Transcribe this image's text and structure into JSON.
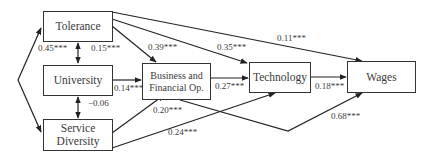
{
  "diagram": {
    "type": "path-model",
    "nodes": [
      {
        "id": "tolerance",
        "label": "Tolerance"
      },
      {
        "id": "university",
        "label": "University"
      },
      {
        "id": "service",
        "label": "Service Diversity",
        "lines": [
          "Service",
          "Diversity"
        ]
      },
      {
        "id": "business",
        "label": "Business and Financial Op.",
        "lines": [
          "Business and",
          "Financial Op."
        ]
      },
      {
        "id": "technology",
        "label": "Technology"
      },
      {
        "id": "wages",
        "label": "Wages"
      }
    ],
    "edges": [
      {
        "from": "tolerance",
        "to": "service",
        "type": "correlation",
        "label": "0.45***"
      },
      {
        "from": "tolerance",
        "to": "university",
        "type": "correlation",
        "label": "0.15***"
      },
      {
        "from": "university",
        "to": "service",
        "type": "correlation",
        "label": "-0.06"
      },
      {
        "from": "tolerance",
        "to": "business",
        "label": "0.39***"
      },
      {
        "from": "tolerance",
        "to": "technology",
        "label": "0.35***"
      },
      {
        "from": "tolerance",
        "to": "wages",
        "label": "0.11***"
      },
      {
        "from": "university",
        "to": "business",
        "label": "0.14***"
      },
      {
        "from": "service",
        "to": "business",
        "label": "0.20***"
      },
      {
        "from": "service",
        "to": "technology",
        "label": "0.24***"
      },
      {
        "from": "business",
        "to": "technology",
        "label": "0.27***"
      },
      {
        "from": "technology",
        "to": "wages",
        "label": "0.18***"
      },
      {
        "from": "business",
        "to": "wages",
        "label": "0.68***"
      }
    ]
  },
  "labels": {
    "tol_serv": "0.45***",
    "tol_univ": "0.15***",
    "univ_serv": "−0.06",
    "tol_bus": "0.39***",
    "tol_tech": "0.35***",
    "tol_wages": "0.11***",
    "univ_bus": "0.14***",
    "serv_bus": "0.20***",
    "serv_tech": "0.24***",
    "bus_tech": "0.27***",
    "tech_wages": "0.18***",
    "bus_wages": "0.68***"
  }
}
